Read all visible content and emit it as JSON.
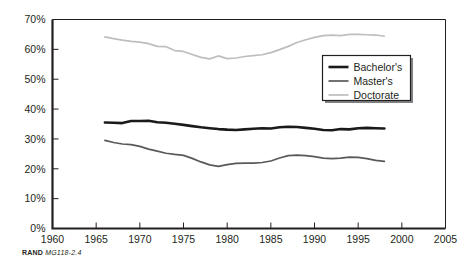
{
  "figure": {
    "source_note_prefix": "RAND",
    "source_note_id": "MG118-2.4"
  },
  "legend": {
    "position": "inside-top-right",
    "items": [
      {
        "label": "Bachelor's",
        "color": "#1a1a1a",
        "width": 2.6
      },
      {
        "label": "Master's",
        "color": "#58595b",
        "width": 1.7
      },
      {
        "label": "Doctorate",
        "color": "#bcbec0",
        "width": 1.7
      }
    ]
  },
  "chart_data": {
    "type": "line",
    "title": "",
    "subtitle": "",
    "xlabel": "",
    "ylabel": "",
    "xlim": [
      1960,
      2005
    ],
    "ylim": [
      0,
      70
    ],
    "grid": false,
    "legend_position": "inside-top-right",
    "xticks": [
      1960,
      1965,
      1970,
      1975,
      1980,
      1985,
      1990,
      1995,
      2000,
      2005
    ],
    "xtick_labels": [
      "1960",
      "1965",
      "1970",
      "1975",
      "1980",
      "1985",
      "1990",
      "1995",
      "2000",
      "2005"
    ],
    "yticks": [
      0,
      10,
      20,
      30,
      40,
      50,
      60,
      70
    ],
    "ytick_labels": [
      "0%",
      "10%",
      "20%",
      "30%",
      "40%",
      "50%",
      "60%",
      "70%"
    ],
    "x": [
      1966,
      1967,
      1968,
      1969,
      1970,
      1971,
      1972,
      1973,
      1974,
      1975,
      1976,
      1977,
      1978,
      1979,
      1980,
      1981,
      1982,
      1983,
      1984,
      1985,
      1986,
      1987,
      1988,
      1989,
      1990,
      1991,
      1992,
      1993,
      1994,
      1995,
      1996,
      1997,
      1998
    ],
    "series": [
      {
        "name": "Bachelor's",
        "color": "#1a1a1a",
        "values": [
          35.5,
          35.4,
          35.3,
          36.0,
          36.0,
          36.1,
          35.6,
          35.4,
          35.1,
          34.7,
          34.3,
          33.9,
          33.6,
          33.3,
          33.1,
          33.0,
          33.2,
          33.4,
          33.6,
          33.5,
          33.9,
          34.1,
          34.0,
          33.7,
          33.4,
          33.0,
          32.9,
          33.3,
          33.2,
          33.6,
          33.7,
          33.6,
          33.5
        ]
      },
      {
        "name": "Master's",
        "color": "#58595b",
        "values": [
          29.5,
          28.8,
          28.3,
          28.1,
          27.5,
          26.6,
          25.9,
          25.2,
          24.8,
          24.5,
          23.5,
          22.3,
          21.3,
          20.8,
          21.4,
          21.8,
          21.9,
          21.9,
          22.1,
          22.6,
          23.6,
          24.4,
          24.6,
          24.4,
          24.1,
          23.6,
          23.4,
          23.6,
          23.9,
          23.8,
          23.4,
          22.8,
          22.5
        ]
      },
      {
        "name": "Doctorate",
        "color": "#bcbec0",
        "values": [
          64.2,
          63.6,
          63.1,
          62.7,
          62.4,
          61.9,
          61.0,
          60.9,
          59.6,
          59.3,
          58.3,
          57.3,
          56.8,
          57.8,
          56.9,
          57.1,
          57.6,
          57.9,
          58.2,
          58.9,
          59.9,
          61.0,
          62.3,
          63.2,
          64.0,
          64.6,
          64.8,
          64.6,
          65.0,
          65.0,
          64.9,
          64.8,
          64.4
        ]
      }
    ]
  }
}
